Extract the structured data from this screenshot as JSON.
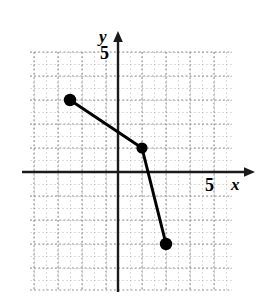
{
  "figure": {
    "kind": "coordinate-plane-line-graph",
    "width": 263,
    "height": 296,
    "background_color": "#ffffff"
  },
  "axes": {
    "x_label": "x",
    "y_label": "y",
    "x_tick_label": "5",
    "y_tick_label": "5",
    "axis_color": "#1a1a1a",
    "x_axis_y_value": 0,
    "y_axis_x_value": 0,
    "xlim": [
      -4,
      5.6
    ],
    "ylim": [
      -5.2,
      5.2
    ],
    "units_per_major_gridline": 1,
    "minor_gridlines_per_major": 2,
    "grid_color": "#9a9a9a",
    "grid_style": "dotted",
    "grid_visible": true,
    "grid_xlim": [
      -3.67,
      4.67
    ],
    "grid_ylim": [
      -4.92,
      5
    ]
  },
  "chart_data": {
    "type": "line",
    "title": "",
    "xlabel": "x",
    "ylabel": "y",
    "xlim": [
      -4,
      5.6
    ],
    "ylim": [
      -5.2,
      5.2
    ],
    "xticks": [
      5
    ],
    "yticks": [
      5
    ],
    "grid": true,
    "legend": null,
    "series": [
      {
        "name": "segments",
        "color": "#000000",
        "line_width": 3,
        "marker": "filled-circle",
        "marker_size": 9,
        "x": [
          -2,
          1,
          2
        ],
        "y": [
          3,
          1,
          -3
        ],
        "points": [
          {
            "label": "point-1",
            "x": -2,
            "y": 3
          },
          {
            "label": "point-2",
            "x": 1,
            "y": 1
          },
          {
            "label": "point-3",
            "x": 2,
            "y": -3
          }
        ]
      }
    ]
  }
}
